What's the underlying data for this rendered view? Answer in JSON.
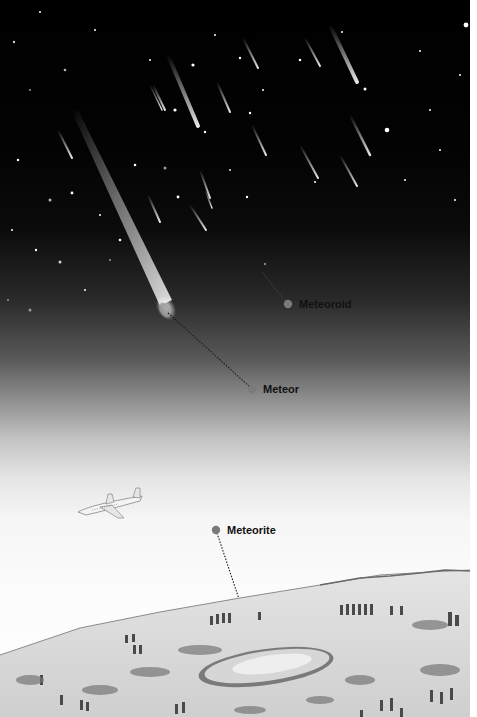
{
  "illustration": {
    "subject": "meteoroid-meteor-meteorite-diagram",
    "labels": [
      {
        "id": "meteoroid",
        "text": "Meteoroid",
        "dot_x": 288,
        "dot_y": 304
      },
      {
        "id": "meteor",
        "text": "Meteor",
        "dot_x": 252,
        "dot_y": 389
      },
      {
        "id": "meteorite",
        "text": "Meteorite",
        "dot_x": 216,
        "dot_y": 530
      }
    ],
    "colors": {
      "sky_top": "#000000",
      "sky_bottom": "#ffffff",
      "label_dot": "#7a7a7a",
      "label_text": "#111111",
      "ground": "#d9d9d9"
    }
  }
}
